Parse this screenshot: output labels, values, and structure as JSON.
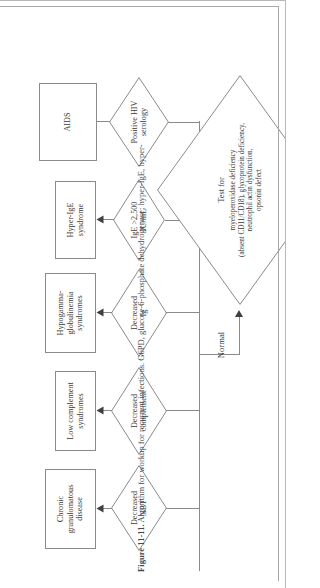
{
  "figure": {
    "caption_number": "Figure 11-11.",
    "caption_text": "Algorithm for workup for recurrent infections. G6PD, glucose-6-phosphate dehydrogenase; hyper-IgE, hyper-",
    "line_color": "#8a8a8a",
    "text_color": "#3a3a3a",
    "background": "#ffffff"
  },
  "nodes": {
    "decisions": [
      {
        "id": "decreased-nbt",
        "label": "Decreased\nNBT"
      },
      {
        "id": "decreased-complement",
        "label": "Decreased\ncomplement"
      },
      {
        "id": "decreased-ig",
        "label": "Decreased\nIg"
      },
      {
        "id": "ige-elevated",
        "label": "IgE >2,500\nIU/mL"
      },
      {
        "id": "positive-hiv",
        "label": "Positive HIV\nserology"
      }
    ],
    "outcomes": [
      {
        "id": "chronic-granulomatous-disease",
        "label": "Chronic\ngranulomatous\ndisease"
      },
      {
        "id": "low-complement-syndromes",
        "label": "Low complement\nsyndromes"
      },
      {
        "id": "hypogammaglobulinemia",
        "label": "Hypogamma-\nglobulinemia\nsyndromes"
      },
      {
        "id": "hyper-ige-syndrome",
        "label": "Hyper-IgE\nsyndrome"
      },
      {
        "id": "aids",
        "label": "AIDS"
      }
    ],
    "normal_branch": {
      "edge_label": "Normal",
      "test_node_title": "Test for",
      "test_node_body": "myeloperoxidase deficiency\n(absent CD11/CD18), glycoprotein deficiency,\nneutrophil actin dysfunction,\nopsonin defect"
    }
  }
}
